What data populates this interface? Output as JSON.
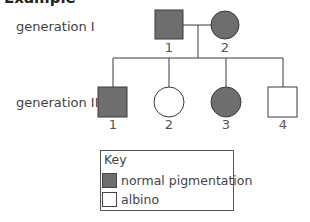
{
  "title": "Example",
  "colors": {
    "affected_fill": "#6e6e6e",
    "unaffected_fill": "#ffffff",
    "stroke": "#3a3a3a"
  },
  "generations": [
    {
      "label": "generation I",
      "individuals": [
        {
          "number": "1",
          "sex": "male",
          "phenotype": "normal pigmentation"
        },
        {
          "number": "2",
          "sex": "female",
          "phenotype": "normal pigmentation"
        }
      ]
    },
    {
      "label": "generation II",
      "individuals": [
        {
          "number": "1",
          "sex": "male",
          "phenotype": "normal pigmentation"
        },
        {
          "number": "2",
          "sex": "female",
          "phenotype": "albino"
        },
        {
          "number": "3",
          "sex": "female",
          "phenotype": "normal pigmentation"
        },
        {
          "number": "4",
          "sex": "male",
          "phenotype": "albino"
        }
      ]
    }
  ],
  "key": {
    "title": "Key",
    "items": [
      {
        "label": "normal pigmentation",
        "fill": "#6e6e6e"
      },
      {
        "label": "albino",
        "fill": "#ffffff"
      }
    ]
  }
}
